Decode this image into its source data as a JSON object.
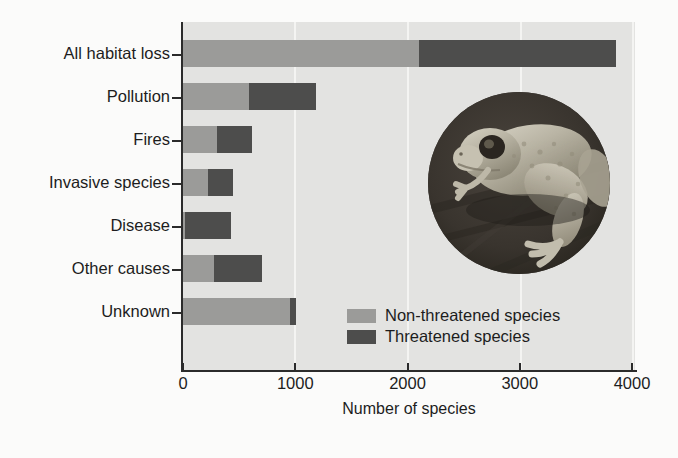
{
  "chart_data": {
    "type": "bar",
    "orientation": "horizontal",
    "stacked": true,
    "title": "",
    "xlabel": "Number of species",
    "ylabel": "",
    "xlim": [
      0,
      4000
    ],
    "xticks": [
      "0",
      "1000",
      "2000",
      "3000",
      "4000"
    ],
    "xtick_values": [
      0,
      1000,
      2000,
      3000,
      4000
    ],
    "grid": "vertical-gridlines",
    "legend_position": "inside-lower-right",
    "categories": [
      "All habitat loss",
      "Pollution",
      "Fires",
      "Invasive species",
      "Disease",
      "Other causes",
      "Unknown"
    ],
    "series": [
      {
        "name": "Non-threatened species",
        "color": "#9b9b99",
        "values": [
          2100,
          585,
          300,
          225,
          20,
          275,
          950
        ]
      },
      {
        "name": "Threatened species",
        "color": "#4d4d4c",
        "values": [
          1756,
          603,
          312,
          220,
          405,
          425,
          60
        ]
      }
    ],
    "totals": [
      3856,
      1188,
      612,
      445,
      425,
      700,
      1010
    ]
  },
  "legend": {
    "items": [
      {
        "label": "Non-threatened species",
        "color": "#9b9b99"
      },
      {
        "label": "Threatened species",
        "color": "#4d4d4c"
      }
    ]
  },
  "inset": {
    "name": "frog-photograph",
    "alt_text": "Photograph of a toad sitting on a dark surface"
  },
  "colors": {
    "non_threatened": "#9b9b99",
    "threatened": "#4d4d4c",
    "panel_background": "#e3e3e1",
    "gridline": "#f4f4f2",
    "axis": "#2b2b2b",
    "text": "#1d1d1d",
    "page_background": "#fbfbfa"
  }
}
